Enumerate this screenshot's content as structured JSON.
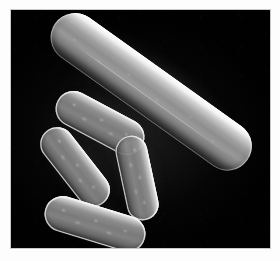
{
  "figure": {
    "kind": "micrograph",
    "modality": "phase-contrast light micrograph",
    "background_color": "#010101",
    "frame_color": "#ffffff",
    "border_color": "#c9c9c9",
    "caption": ""
  },
  "field": {
    "label": "dark microscopy field",
    "width_px": 259,
    "height_px": 238,
    "origin_x_px": 11,
    "origin_y_px": 10
  },
  "specimens": [
    {
      "id": "macroconidium",
      "label": "macroconidium",
      "shape": "elongated fusiform",
      "orientation_deg": 35.5,
      "length_px": 236,
      "width_px": 49,
      "brightness": "very bright",
      "highlight_color": "#fafafa",
      "shadow_color": "#484848",
      "note": "large curved spore running from lower-left to upper-right"
    },
    {
      "id": "conidium-1",
      "label": "conidium",
      "shape": "ellipsoidal",
      "orientation_deg": 28,
      "length_px": 96,
      "width_px": 36,
      "brightness": "medium",
      "highlight_color": "#dedede",
      "shadow_color": "#4e4e4e",
      "note": "upper-left small cell overlapping the macroconidium"
    },
    {
      "id": "conidium-2",
      "label": "conidium",
      "shape": "ellipsoidal",
      "orientation_deg": 52,
      "length_px": 92,
      "width_px": 34,
      "brightness": "medium",
      "highlight_color": "#dedede",
      "shadow_color": "#4e4e4e",
      "note": "left cell angled down-right"
    },
    {
      "id": "conidium-3",
      "label": "conidium",
      "shape": "ellipsoidal",
      "orientation_deg": 78,
      "length_px": 86,
      "width_px": 32,
      "brightness": "medium",
      "highlight_color": "#dedede",
      "shadow_color": "#4e4e4e",
      "note": "centre-right near-vertical cell"
    },
    {
      "id": "conidium-4",
      "label": "conidium",
      "shape": "ellipsoidal",
      "orientation_deg": 17,
      "length_px": 104,
      "width_px": 36,
      "brightness": "medium",
      "highlight_color": "#dedede",
      "shadow_color": "#4e4e4e",
      "note": "bottom cell with shallow tilt"
    }
  ]
}
